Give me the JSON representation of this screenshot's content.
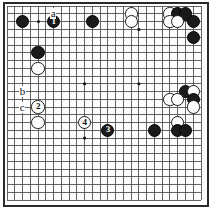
{
  "figure": {
    "kind": "go-board-diagram",
    "board": {
      "columns": 20,
      "rows": 20,
      "line_color": "#4a4a4a",
      "border_color": "#2b2b2b",
      "background_color": "#fdfdfd"
    },
    "star_points": [
      {
        "col": 10,
        "row": 10
      },
      {
        "col": 17,
        "row": 10
      },
      {
        "col": 17,
        "row": 3
      },
      {
        "col": 10,
        "row": 17
      }
    ],
    "marker_dots": [
      {
        "col": 4,
        "row": 2
      }
    ],
    "stones": [
      {
        "id": "s01",
        "color": "black",
        "col": 2,
        "row": 2,
        "label": ""
      },
      {
        "id": "s02",
        "color": "black",
        "col": 6,
        "row": 2,
        "label": "1"
      },
      {
        "id": "s03",
        "color": "black",
        "col": 11,
        "row": 2,
        "label": ""
      },
      {
        "id": "s04",
        "color": "white",
        "col": 16,
        "row": 1,
        "label": ""
      },
      {
        "id": "s05",
        "color": "white",
        "col": 16,
        "row": 2,
        "label": ""
      },
      {
        "id": "s06",
        "color": "white",
        "col": 21,
        "row": 1,
        "label": ""
      },
      {
        "id": "s07",
        "color": "black",
        "col": 22,
        "row": 1,
        "label": ""
      },
      {
        "id": "s08",
        "color": "black",
        "col": 23,
        "row": 1,
        "label": ""
      },
      {
        "id": "s09",
        "color": "white",
        "col": 21,
        "row": 2,
        "label": ""
      },
      {
        "id": "s10",
        "color": "white",
        "col": 22,
        "row": 2,
        "label": ""
      },
      {
        "id": "s11",
        "color": "black",
        "col": 24,
        "row": 2,
        "label": ""
      },
      {
        "id": "s12",
        "color": "black",
        "col": 24,
        "row": 4,
        "label": ""
      },
      {
        "id": "s13",
        "color": "black",
        "col": 4,
        "row": 6,
        "label": ""
      },
      {
        "id": "s14",
        "color": "white",
        "col": 4,
        "row": 8,
        "label": ""
      },
      {
        "id": "s15",
        "color": "white",
        "col": 4,
        "row": 13,
        "label": "2"
      },
      {
        "id": "s16",
        "color": "white",
        "col": 4,
        "row": 15,
        "label": ""
      },
      {
        "id": "s17",
        "color": "black",
        "col": 23,
        "row": 11,
        "label": ""
      },
      {
        "id": "s18",
        "color": "white",
        "col": 24,
        "row": 11,
        "label": ""
      },
      {
        "id": "s19",
        "color": "white",
        "col": 21,
        "row": 12,
        "label": ""
      },
      {
        "id": "s20",
        "color": "white",
        "col": 22,
        "row": 12,
        "label": ""
      },
      {
        "id": "s21",
        "color": "black",
        "col": 24,
        "row": 12,
        "label": ""
      },
      {
        "id": "s22",
        "color": "white",
        "col": 24,
        "row": 13,
        "label": ""
      },
      {
        "id": "s23",
        "color": "white",
        "col": 22,
        "row": 15,
        "label": ""
      },
      {
        "id": "s24",
        "color": "white",
        "col": 10,
        "row": 15,
        "label": "4"
      },
      {
        "id": "s25",
        "color": "black",
        "col": 13,
        "row": 16,
        "label": "3"
      },
      {
        "id": "s26",
        "color": "black",
        "col": 19,
        "row": 16,
        "label": ""
      },
      {
        "id": "s27",
        "color": "black",
        "col": 22,
        "row": 16,
        "label": ""
      },
      {
        "id": "s28",
        "color": "black",
        "col": 23,
        "row": 16,
        "label": ""
      }
    ],
    "point_labels": [
      {
        "id": "lbl-a",
        "text": "a",
        "col": 6,
        "row": 1
      },
      {
        "id": "lbl-b",
        "text": "b",
        "col": 2,
        "row": 11
      },
      {
        "id": "lbl-c",
        "text": "c",
        "col": 2,
        "row": 13
      }
    ]
  }
}
